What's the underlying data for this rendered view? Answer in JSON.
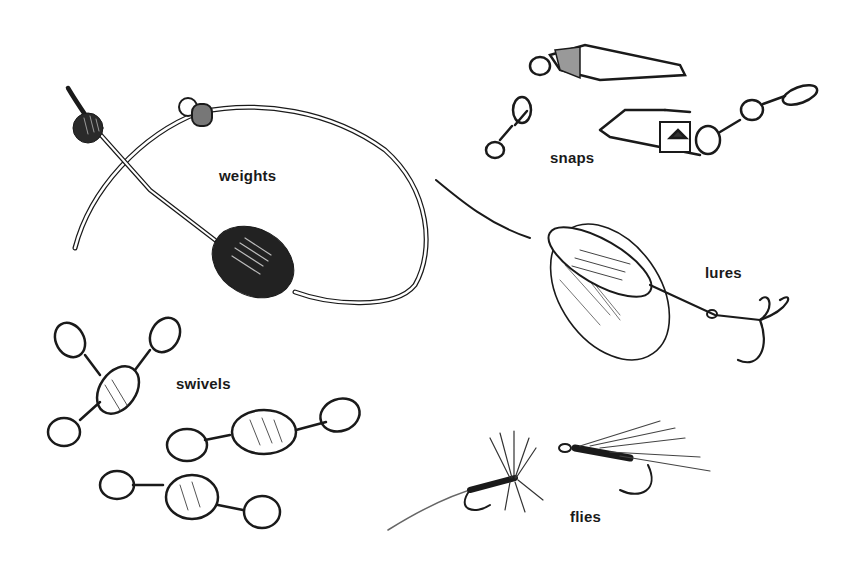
{
  "diagram": {
    "labels": {
      "weights": "weights",
      "snaps": "snaps",
      "lures": "lures",
      "swivels": "swivels",
      "flies": "flies"
    }
  },
  "colors": {
    "ink": "#1a1a1a",
    "background": "#ffffff",
    "shade": "#555555"
  }
}
